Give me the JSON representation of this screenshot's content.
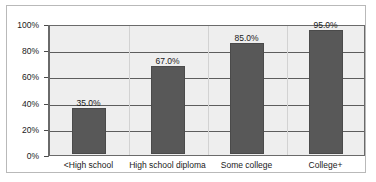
{
  "chart_data": {
    "type": "bar",
    "title": "",
    "subtitle": "",
    "xlabel": "",
    "ylabel": "",
    "categories": [
      "<High school",
      "High school diploma",
      "Some college",
      "College+"
    ],
    "values": [
      35.0,
      67.0,
      85.0,
      95.0
    ],
    "value_labels": [
      "35.0%",
      "67.0%",
      "85.0%",
      "95.0%"
    ],
    "ylim": [
      0,
      100
    ],
    "ytick_values": [
      100,
      80,
      60,
      40,
      20,
      0
    ],
    "ytick_labels": [
      "100%",
      "80%",
      "60%",
      "40%",
      "20%",
      "0%"
    ],
    "grid": true,
    "legend": false,
    "legend_position": "none",
    "bar_color": "#585858",
    "plot_background": "#eeeeee",
    "gridline_color": "#5d5d5d",
    "axis_color": "#6a6a6a",
    "text_color": "#1a1a1a"
  }
}
